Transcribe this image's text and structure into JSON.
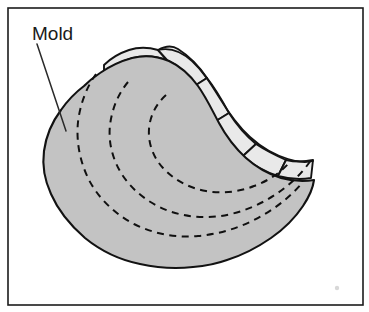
{
  "figure": {
    "width": 369,
    "height": 312,
    "background_color": "#ffffff",
    "frame": {
      "x": 8,
      "y": 8,
      "width": 355,
      "height": 297,
      "stroke_color": "#1c1c1c"
    }
  },
  "labels": {
    "mold": "Mold"
  },
  "annotations": {
    "leader_line": {
      "from_x": 37,
      "from_y": 44,
      "to_x": 66,
      "to_y": 131
    }
  },
  "colors": {
    "mold_fill": "#c3c3c3",
    "fan_fill": "#e9e9e9",
    "outline": "#121212",
    "dashed_arc": "#101010",
    "leader": "#2a2a2a",
    "frame": "#1c1c1c",
    "background": "#ffffff"
  },
  "geometry": {
    "mold_body_path": "M 84 86 C 76 92 68 100 61 110 C 52 122 46 136 44 151 C 42 166 45 181 51 194 C 58 210 70 225 85 238 C 101 251 120 260 140 264 C 158 268 176 269 193 267 C 205 266 216 264 227 260 C 243 255 258 247 271 238 C 284 229 295 218 303 206 C 309 197 313 188 314 180 C 303 182 292 181 281 178 C 268 174 256 167 246 158 C 235 148 226 136 219 123 C 212 110 206 97 198 86 C 190 75 180 66 169 61 C 157 56 144 55 132 58 C 121 61 110 66 100 73 C 94 77 89 81 84 86 Z",
    "fan_segments": [
      {
        "name": "fan-segment-1",
        "path": "M 104 73 C 112 66 122 61 133 58 C 144 55 156 56 167 60 L 158 50 C 148 47 138 47 129 50 C 120 53 111 58 104 65 Z"
      },
      {
        "name": "fan-segment-2",
        "path": "M 158 50 L 167 60 C 178 65 188 74 196 85 L 207 78 C 199 66 189 56 178 49 C 172 45 165 46 158 50 Z"
      },
      {
        "name": "fan-segment-3",
        "path": "M 196 85 C 203 96 209 109 216 121 L 229 113 C 222 100 215 88 207 78 Z"
      },
      {
        "name": "fan-segment-4",
        "path": "M 216 121 C 223 134 232 146 243 156 L 256 144 C 245 135 236 124 229 113 Z"
      },
      {
        "name": "fan-segment-5",
        "path": "M 243 156 C 253 165 265 172 278 176 L 286 160 C 275 155 265 150 256 144 Z"
      },
      {
        "name": "fan-segment-6",
        "path": "M 278 176 C 289 179 300 180 311 178 L 313 160 C 304 162 295 162 286 160 Z"
      }
    ],
    "fan_outer_edge": "M 158 50 C 170 47 182 52 192 61 C 203 71 211 84 219 97 C 228 112 238 126 250 137 C 261 147 274 155 288 159 C 297 162 305 163 313 161",
    "growth_arcs": [
      {
        "name": "growth-arc-outer",
        "path": "M 96 74 C 86 88 80 105 78 122 C 76 142 80 162 89 180 C 99 199 115 214 134 224 C 154 234 176 238 198 236 C 222 234 245 226 265 214 C 280 205 293 194 303 182"
      },
      {
        "name": "growth-arc-middle",
        "path": "M 128 82 C 118 94 112 109 110 125 C 108 143 113 161 123 176 C 134 192 150 204 169 211 C 189 218 210 219 231 214 C 252 209 271 199 287 186 C 297 178 305 169 311 160"
      },
      {
        "name": "growth-arc-inner",
        "path": "M 166 95 C 156 104 150 116 149 129 C 148 143 153 157 163 168 C 174 180 189 188 206 191 C 222 194 239 192 254 186 C 268 181 280 173 289 163"
      }
    ]
  }
}
